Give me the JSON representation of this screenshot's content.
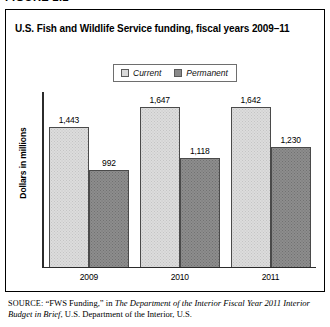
{
  "figure": {
    "label": "FIGURE 2.2"
  },
  "chart_title": "U.S. Fish and Wildlife Service funding, fiscal years 2009–11",
  "axis": {
    "ylabel": "Dollars in millions"
  },
  "legend": {
    "items": [
      {
        "label": "Current",
        "color": "#d9d9d9",
        "swatch": "current"
      },
      {
        "label": "Permanent",
        "color": "#8a8a8a",
        "swatch": "permanent"
      }
    ]
  },
  "source": {
    "kicker": "SOURCE:",
    "part1": " “FWS Funding,” in ",
    "italic1": "The Department of the Interior Fiscal Year 2011 Interior Budget in Brief",
    "part2": ", U.S. Department of the Interior, U.S."
  },
  "chart_data": {
    "type": "bar",
    "title": "U.S. Fish and Wildlife Service funding, fiscal years 2009–11",
    "xlabel": "",
    "ylabel": "Dollars in millions",
    "categories": [
      "2009",
      "2010",
      "2011"
    ],
    "series": [
      {
        "name": "Current",
        "values": [
          1443,
          1647,
          1642
        ],
        "labels": [
          "1,443",
          "1,647",
          "1,642"
        ],
        "color": "#dcdcdc"
      },
      {
        "name": "Permanent",
        "values": [
          992,
          1118,
          1230
        ],
        "labels": [
          "992",
          "1,118",
          "1,230"
        ],
        "color": "#8d8d8d"
      }
    ],
    "ylim": [
      0,
      1800
    ],
    "grid": false,
    "legend_position": "top-center",
    "value_labels": true,
    "axis_ticks": false
  }
}
